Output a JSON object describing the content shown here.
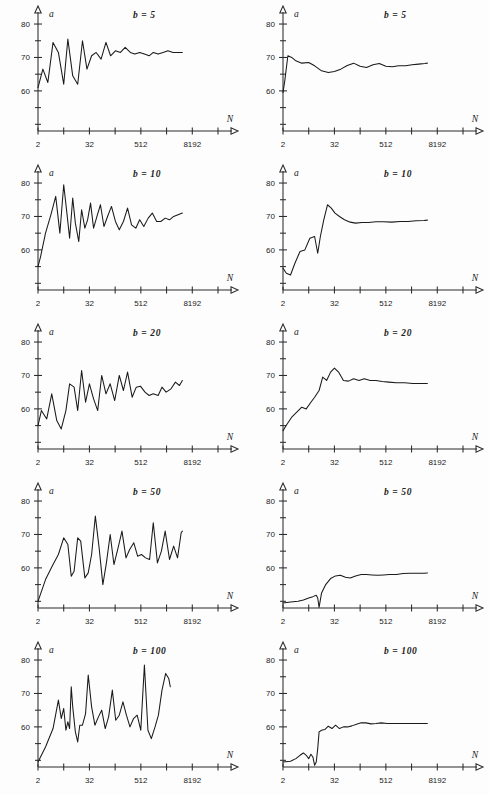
{
  "figure": {
    "title": "",
    "rows": 5,
    "cols": 2
  },
  "axes": {
    "y_label": "a",
    "x_label": "N",
    "y_ticks_labeled": [
      "80",
      "70",
      "60"
    ],
    "y_tick_values": [
      80,
      75,
      70,
      65,
      60,
      55,
      50
    ],
    "x_ticks_labeled": [
      "2",
      "32",
      "512",
      "8192"
    ],
    "x_tick_values": [
      2,
      8,
      32,
      128,
      512,
      2048,
      8192,
      32768
    ]
  },
  "panel_labels": {
    "b5": "b = 5",
    "b10": "b = 10",
    "b20": "b = 20",
    "b50": "b = 50",
    "b100": "b = 100"
  },
  "colors": {
    "curve": "#1a1a1a",
    "axis": "#2b2b2b",
    "background": "#fdfdfd"
  },
  "chart_data": [
    {
      "id": "b5-left",
      "type": "line",
      "title": "b = 5",
      "xlabel": "N",
      "ylabel": "a",
      "xscale": "log2",
      "xlim": [
        2,
        32768
      ],
      "ylim": [
        48,
        83
      ],
      "grid": false,
      "legend": "none",
      "x": [
        2,
        2.6,
        3.4,
        4.5,
        6,
        8,
        10,
        13,
        17,
        22,
        28,
        36,
        46,
        60,
        78,
        100,
        130,
        170,
        220,
        290,
        370,
        480,
        620,
        800,
        1000,
        1300,
        1700,
        2200,
        2900,
        3700,
        4800
      ],
      "y": [
        61.0,
        66.5,
        62.5,
        74.5,
        71.5,
        62.0,
        75.5,
        64.5,
        62.0,
        75.0,
        66.5,
        70.5,
        71.5,
        69.5,
        74.5,
        70.5,
        72.0,
        71.5,
        73.0,
        71.5,
        71.0,
        71.5,
        71.0,
        70.5,
        71.5,
        71.0,
        71.5,
        72.0,
        71.5,
        71.5,
        71.5
      ]
    },
    {
      "id": "b5-right",
      "type": "line",
      "title": "b = 5",
      "xlabel": "N",
      "ylabel": "a",
      "xscale": "log2",
      "xlim": [
        2,
        32768
      ],
      "ylim": [
        48,
        83
      ],
      "grid": false,
      "legend": "none",
      "x": [
        2,
        2.2,
        2.6,
        3.2,
        4,
        5.5,
        8,
        11,
        16,
        23,
        32,
        45,
        64,
        90,
        128,
        180,
        256,
        360,
        512,
        720,
        1024,
        1500,
        2100,
        3000,
        4200,
        4800
      ],
      "y": [
        59.5,
        63.0,
        70.5,
        70.0,
        69.0,
        68.3,
        68.5,
        67.5,
        66.0,
        65.5,
        65.8,
        66.5,
        67.6,
        68.3,
        67.4,
        67.0,
        67.8,
        68.2,
        67.4,
        67.2,
        67.5,
        67.5,
        67.8,
        68.0,
        68.2,
        68.3
      ]
    },
    {
      "id": "b10-left",
      "type": "line",
      "title": "b = 10",
      "xlabel": "N",
      "ylabel": "a",
      "xscale": "log2",
      "xlim": [
        2,
        32768
      ],
      "ylim": [
        48,
        83
      ],
      "grid": false,
      "legend": "none",
      "x": [
        2,
        2.3,
        3,
        4,
        5.2,
        6.5,
        8,
        9.5,
        11,
        13,
        15,
        18,
        21,
        25,
        29,
        34,
        40,
        48,
        58,
        70,
        85,
        105,
        130,
        160,
        200,
        250,
        310,
        390,
        480,
        600,
        760,
        950,
        1200,
        1500,
        1900,
        2400,
        3000,
        3800,
        4800
      ],
      "y": [
        55.0,
        58.0,
        65.0,
        70.5,
        76.0,
        65.0,
        79.5,
        71.0,
        63.5,
        75.5,
        68.0,
        62.5,
        72.0,
        66.5,
        69.0,
        74.0,
        66.5,
        70.0,
        73.5,
        67.0,
        70.0,
        73.0,
        68.5,
        66.0,
        68.5,
        72.5,
        67.5,
        66.5,
        69.0,
        67.0,
        69.5,
        71.0,
        68.5,
        68.5,
        69.5,
        69.0,
        70.0,
        70.5,
        71.0
      ]
    },
    {
      "id": "b10-right",
      "type": "line",
      "title": "b = 10",
      "xlabel": "N",
      "ylabel": "a",
      "xscale": "log2",
      "xlim": [
        2,
        32768
      ],
      "ylim": [
        48,
        83
      ],
      "grid": false,
      "legend": "none",
      "x": [
        2,
        2.4,
        3,
        3.8,
        5,
        6.5,
        8.5,
        11,
        13,
        15,
        18,
        22,
        27,
        33,
        42,
        55,
        75,
        100,
        140,
        200,
        300,
        450,
        700,
        1100,
        1700,
        2600,
        4000,
        4800
      ],
      "y": [
        54.5,
        53.0,
        52.5,
        56.0,
        59.5,
        60.0,
        63.5,
        64.0,
        59.0,
        64.0,
        69.0,
        73.5,
        72.5,
        71.0,
        70.0,
        69.0,
        68.3,
        68.0,
        68.2,
        68.2,
        68.4,
        68.4,
        68.3,
        68.5,
        68.5,
        68.7,
        68.8,
        68.9
      ]
    },
    {
      "id": "b20-left",
      "type": "line",
      "title": "b = 20",
      "xlabel": "N",
      "ylabel": "a",
      "xscale": "log2",
      "xlim": [
        2,
        32768
      ],
      "ylim": [
        48,
        83
      ],
      "grid": false,
      "legend": "none",
      "x": [
        2,
        2.4,
        3.2,
        4.2,
        5.5,
        7,
        9,
        11,
        14,
        17,
        21,
        26,
        32,
        40,
        50,
        62,
        78,
        98,
        125,
        160,
        200,
        250,
        320,
        400,
        500,
        640,
        800,
        1000,
        1300,
        1600,
        2000,
        2600,
        3300,
        4100,
        4800
      ],
      "y": [
        55.0,
        59.5,
        57.0,
        64.5,
        56.5,
        54.0,
        59.5,
        67.5,
        66.5,
        59.5,
        71.5,
        62.0,
        67.5,
        63.0,
        59.5,
        70.0,
        64.5,
        67.5,
        62.5,
        70.0,
        65.5,
        71.0,
        63.5,
        66.5,
        66.8,
        65.0,
        64.0,
        64.5,
        64.0,
        66.5,
        65.0,
        66.0,
        68.0,
        67.0,
        68.5
      ]
    },
    {
      "id": "b20-right",
      "type": "line",
      "title": "b = 20",
      "xlabel": "N",
      "ylabel": "a",
      "xscale": "log2",
      "xlim": [
        2,
        32768
      ],
      "ylim": [
        48,
        83
      ],
      "grid": false,
      "legend": "none",
      "x": [
        2,
        2.5,
        3.2,
        4.2,
        5.5,
        7,
        9,
        11,
        14,
        17,
        21,
        26,
        32,
        40,
        52,
        68,
        90,
        120,
        160,
        220,
        300,
        420,
        600,
        900,
        1400,
        2200,
        3400,
        4800
      ],
      "y": [
        53.5,
        55.5,
        57.5,
        59.0,
        60.5,
        60.0,
        62.0,
        63.5,
        65.5,
        69.5,
        68.5,
        71.0,
        72.2,
        71.0,
        68.5,
        68.3,
        69.0,
        68.5,
        69.0,
        68.5,
        68.5,
        68.2,
        68.0,
        67.8,
        67.8,
        67.6,
        67.6,
        67.6
      ]
    },
    {
      "id": "b50-left",
      "type": "line",
      "title": "b = 50",
      "xlabel": "N",
      "ylabel": "a",
      "xscale": "log2",
      "xlim": [
        2,
        32768
      ],
      "ylim": [
        48,
        83
      ],
      "grid": false,
      "legend": "none",
      "x": [
        2,
        3,
        4.5,
        6,
        8,
        10,
        12,
        14,
        17,
        20,
        25,
        30,
        36,
        44,
        54,
        66,
        80,
        98,
        120,
        150,
        185,
        230,
        280,
        350,
        430,
        530,
        660,
        820,
        1000,
        1250,
        1550,
        1900,
        2400,
        3000,
        3700,
        4500,
        4800
      ],
      "y": [
        50.0,
        56.5,
        61.0,
        64.0,
        69.0,
        67.0,
        57.5,
        59.0,
        69.0,
        68.0,
        57.0,
        58.5,
        64.0,
        75.5,
        66.0,
        55.0,
        61.5,
        70.0,
        61.0,
        66.0,
        71.0,
        63.0,
        65.5,
        67.5,
        63.5,
        64.0,
        63.0,
        62.5,
        73.5,
        61.5,
        65.0,
        71.0,
        62.5,
        66.5,
        63.0,
        70.5,
        71.0
      ]
    },
    {
      "id": "b50-right",
      "type": "line",
      "title": "b = 50",
      "xlabel": "N",
      "ylabel": "a",
      "xscale": "log2",
      "xlim": [
        2,
        32768
      ],
      "ylim": [
        48,
        83
      ],
      "grid": false,
      "legend": "none",
      "x": [
        2,
        3,
        4.5,
        6,
        8,
        10,
        12,
        13,
        14,
        16,
        20,
        26,
        34,
        44,
        58,
        75,
        100,
        135,
        180,
        240,
        330,
        450,
        620,
        900,
        1300,
        1900,
        2800,
        4000,
        4800
      ],
      "y": [
        49.5,
        49.8,
        50.0,
        50.4,
        51.0,
        51.4,
        51.8,
        51.0,
        48.2,
        52.5,
        55.0,
        56.8,
        57.6,
        57.8,
        57.2,
        57.0,
        57.6,
        58.0,
        58.0,
        57.9,
        57.8,
        57.9,
        58.0,
        58.0,
        58.3,
        58.4,
        58.4,
        58.4,
        58.5
      ]
    },
    {
      "id": "b100-left",
      "type": "line",
      "title": "b = 100",
      "xlabel": "N",
      "ylabel": "a",
      "xscale": "log2",
      "xlim": [
        2,
        32768
      ],
      "ylim": [
        48,
        83
      ],
      "grid": false,
      "legend": "none",
      "x": [
        2,
        3,
        4.5,
        6,
        7,
        8,
        9,
        10,
        11,
        12,
        13,
        15,
        17,
        19,
        22,
        26,
        30,
        36,
        43,
        52,
        62,
        75,
        90,
        110,
        132,
        160,
        195,
        235,
        285,
        345,
        420,
        510,
        620,
        750,
        900,
        1100,
        1320,
        1600,
        1950,
        2300,
        2500
      ],
      "y": [
        49.5,
        54.0,
        59.5,
        68.0,
        62.5,
        65.5,
        59.0,
        61.5,
        59.5,
        72.0,
        66.0,
        58.5,
        55.5,
        60.5,
        60.5,
        64.0,
        75.5,
        66.0,
        60.5,
        63.0,
        65.0,
        59.5,
        63.0,
        71.0,
        62.0,
        63.5,
        67.5,
        63.5,
        60.0,
        62.5,
        63.5,
        59.0,
        78.5,
        59.0,
        56.5,
        60.0,
        63.5,
        71.0,
        76.0,
        74.5,
        72.0
      ]
    },
    {
      "id": "b100-right",
      "type": "line",
      "title": "b = 100",
      "xlabel": "N",
      "ylabel": "a",
      "xscale": "log2",
      "xlim": [
        2,
        32768
      ],
      "ylim": [
        48,
        83
      ],
      "grid": false,
      "legend": "none",
      "x": [
        2,
        3,
        4,
        5,
        6,
        7,
        8,
        9,
        10,
        11,
        12,
        13,
        14,
        16,
        19,
        23,
        28,
        34,
        42,
        52,
        65,
        82,
        105,
        135,
        175,
        230,
        300,
        400,
        550,
        780,
        1100,
        1600,
        2300,
        3200,
        4400,
        4800
      ],
      "y": [
        49.5,
        49.7,
        50.5,
        51.5,
        52.2,
        51.5,
        50.5,
        51.8,
        51.0,
        48.5,
        49.5,
        53.5,
        58.5,
        59.0,
        59.2,
        60.2,
        59.5,
        60.5,
        59.5,
        60.0,
        60.0,
        60.3,
        60.8,
        61.2,
        61.2,
        60.9,
        61.0,
        61.2,
        61.0,
        61.0,
        61.0,
        61.0,
        61.0,
        61.0,
        61.0,
        61.0
      ]
    }
  ]
}
